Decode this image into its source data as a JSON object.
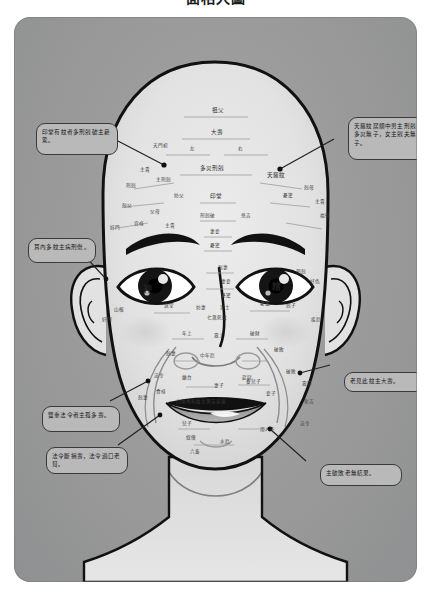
{
  "title": "面相大圖",
  "panel": {
    "background_color": "#9c9c9c",
    "callout_fill": "#b9b9b9",
    "callout_border": "#3a3a3a",
    "face_fill": "#e3e3e3",
    "line_color": "#111111"
  },
  "callouts": [
    {
      "id": "yintang",
      "text": "印堂有紋者多刑剋破主憂驚。",
      "x": 22,
      "y": 106,
      "w": 82,
      "h": 32,
      "anchor_x": 148,
      "anchor_y": 146
    },
    {
      "id": "tianluo",
      "text": "天羅紋居額中男主刑剋多災無子，女主剋夫無子。",
      "x": 334,
      "y": 100,
      "w": 78,
      "h": 43,
      "anchor_x": 281,
      "anchor_y": 152
    },
    {
      "id": "ear-lines",
      "text": "耳內多紋主病刑傷。",
      "x": 14,
      "y": 221,
      "w": 68,
      "h": 25,
      "anchor_x": 84,
      "anchor_y": 270
    },
    {
      "id": "old-longevity",
      "text": "老見此紋主大壽。",
      "x": 330,
      "y": 355,
      "w": 80,
      "h": 20,
      "anchor_x": 300,
      "anchor_y": 372
    },
    {
      "id": "double-faling",
      "text": "雙重法令者主孤多壽。",
      "x": 28,
      "y": 389,
      "w": 78,
      "h": 26,
      "anchor_x": 136,
      "anchor_y": 378
    },
    {
      "id": "faling-broken",
      "text": "法令斷損壽，法令過口老貧。",
      "x": 32,
      "y": 430,
      "w": 82,
      "h": 27,
      "anchor_x": 150,
      "anchor_y": 404
    },
    {
      "id": "ruin-no-result",
      "text": "主破敗老無結果。",
      "x": 306,
      "y": 447,
      "w": 82,
      "h": 22,
      "anchor_x": 246,
      "anchor_y": 420
    }
  ],
  "face_labels": {
    "forehead": [
      {
        "t": "祖父",
        "x": 198,
        "y": 90,
        "cls": "rlabel mid"
      },
      {
        "t": "大壽",
        "x": 197,
        "y": 112,
        "cls": "rlabel mid"
      },
      {
        "t": "左",
        "x": 176,
        "y": 129,
        "cls": "rlabel"
      },
      {
        "t": "右",
        "x": 224,
        "y": 129,
        "cls": "rlabel"
      },
      {
        "t": "多災刑剋",
        "x": 186,
        "y": 148,
        "cls": "rlabel mid"
      },
      {
        "t": "天門初",
        "x": 139,
        "y": 126,
        "cls": "rlabel"
      },
      {
        "t": "天羅紋",
        "x": 253,
        "y": 155,
        "cls": "rlabel mid"
      },
      {
        "t": "主貴",
        "x": 126,
        "y": 150,
        "cls": "rlabel"
      },
      {
        "t": "刑剋",
        "x": 112,
        "y": 166,
        "cls": "rlabel"
      },
      {
        "t": "剋父",
        "x": 108,
        "y": 186,
        "cls": "rlabel"
      },
      {
        "t": "奸門",
        "x": 96,
        "y": 208,
        "cls": "rlabel"
      },
      {
        "t": "主貴",
        "x": 301,
        "y": 182,
        "cls": "rlabel"
      },
      {
        "t": "剋母",
        "x": 290,
        "y": 168,
        "cls": "rlabel"
      },
      {
        "t": "憂驚",
        "x": 269,
        "y": 176,
        "cls": "rlabel"
      },
      {
        "t": "妨父",
        "x": 160,
        "y": 176,
        "cls": "rlabel"
      },
      {
        "t": "印堂",
        "x": 196,
        "y": 176,
        "cls": "rlabel mid"
      },
      {
        "t": "刑剋破",
        "x": 186,
        "y": 196,
        "cls": "rlabel"
      },
      {
        "t": "兇吉",
        "x": 227,
        "y": 196,
        "cls": "rlabel"
      },
      {
        "t": "父母",
        "x": 136,
        "y": 192,
        "cls": "rlabel"
      },
      {
        "t": "官祿",
        "x": 120,
        "y": 204,
        "cls": "rlabel"
      },
      {
        "t": "主刑剋",
        "x": 142,
        "y": 160,
        "cls": "rlabel"
      },
      {
        "t": "主貴",
        "x": 151,
        "y": 206,
        "cls": "rlabel"
      },
      {
        "t": "妻妾",
        "x": 196,
        "y": 212,
        "cls": "rlabel"
      },
      {
        "t": "憂驚",
        "x": 196,
        "y": 226,
        "cls": "rlabel"
      },
      {
        "t": "福德",
        "x": 306,
        "y": 196,
        "cls": "rlabel"
      }
    ],
    "eyes": [
      {
        "t": "神",
        "x": 129,
        "y": 267,
        "cls": "rlabel big"
      },
      {
        "t": "精",
        "x": 258,
        "y": 265,
        "cls": "rlabel big"
      },
      {
        "t": "剋妻",
        "x": 204,
        "y": 248,
        "cls": "rlabel"
      },
      {
        "t": "妻妾",
        "x": 207,
        "y": 262,
        "cls": "rlabel"
      },
      {
        "t": "憂驚",
        "x": 207,
        "y": 276,
        "cls": "rlabel"
      },
      {
        "t": "刑剋",
        "x": 282,
        "y": 252,
        "cls": "rlabel"
      },
      {
        "t": "好色",
        "x": 296,
        "y": 262,
        "cls": "rlabel"
      },
      {
        "t": "淚堂",
        "x": 150,
        "y": 286,
        "cls": "rlabel"
      },
      {
        "t": "妨妻",
        "x": 182,
        "y": 288,
        "cls": "rlabel"
      },
      {
        "t": "男士",
        "x": 206,
        "y": 288,
        "cls": "rlabel"
      },
      {
        "t": "憂驚",
        "x": 246,
        "y": 284,
        "cls": "rlabel"
      },
      {
        "t": "剋子",
        "x": 272,
        "y": 286,
        "cls": "rlabel"
      },
      {
        "t": "七煞死紋",
        "x": 193,
        "y": 298,
        "cls": "rlabel"
      },
      {
        "t": "山根",
        "x": 100,
        "y": 290,
        "cls": "rlabel"
      },
      {
        "t": "奸門",
        "x": 88,
        "y": 300,
        "cls": "rlabel"
      },
      {
        "t": "疾厄",
        "x": 297,
        "y": 300,
        "cls": "rlabel"
      }
    ],
    "nose_cheek": [
      {
        "t": "年上",
        "x": 168,
        "y": 314,
        "cls": "rlabel"
      },
      {
        "t": "壽上",
        "x": 200,
        "y": 316,
        "cls": "rlabel"
      },
      {
        "t": "破財",
        "x": 236,
        "y": 314,
        "cls": "rlabel"
      },
      {
        "t": "中年厄",
        "x": 186,
        "y": 336,
        "cls": "rlabel"
      },
      {
        "t": "剋妻",
        "x": 152,
        "y": 334,
        "cls": "rlabel"
      },
      {
        "t": "破敗",
        "x": 260,
        "y": 330,
        "cls": "rlabel"
      },
      {
        "t": "法令",
        "x": 140,
        "y": 356,
        "cls": "rlabel"
      },
      {
        "t": "破敗",
        "x": 272,
        "y": 352,
        "cls": "rlabel"
      },
      {
        "t": "蘭台",
        "x": 168,
        "y": 358,
        "cls": "rlabel"
      },
      {
        "t": "廷尉",
        "x": 228,
        "y": 358,
        "cls": "rlabel"
      }
    ],
    "mouth": [
      {
        "t": "妻子",
        "x": 200,
        "y": 366,
        "cls": "rlabel"
      },
      {
        "t": "養兒子",
        "x": 232,
        "y": 362,
        "cls": "rlabel"
      },
      {
        "t": "食祿",
        "x": 142,
        "y": 372,
        "cls": "rlabel"
      },
      {
        "t": "妾子",
        "x": 252,
        "y": 374,
        "cls": "rlabel"
      },
      {
        "t": "壽帶",
        "x": 288,
        "y": 364,
        "cls": "rlabel"
      },
      {
        "t": "口角內有紋主勞苦奔波",
        "x": 162,
        "y": 382,
        "cls": "rlabel"
      },
      {
        "t": "化吉",
        "x": 290,
        "y": 382,
        "cls": "rlabel"
      },
      {
        "t": "剋妻",
        "x": 124,
        "y": 378,
        "cls": "rlabel"
      },
      {
        "t": "兒子",
        "x": 168,
        "y": 404,
        "cls": "rlabel"
      },
      {
        "t": "法令",
        "x": 286,
        "y": 404,
        "cls": "rlabel"
      },
      {
        "t": "用人不",
        "x": 246,
        "y": 410,
        "cls": "rlabel"
      },
      {
        "t": "奴僕",
        "x": 172,
        "y": 418,
        "cls": "rlabel"
      },
      {
        "t": "水厄",
        "x": 206,
        "y": 422,
        "cls": "rlabel"
      },
      {
        "t": "六畜",
        "x": 176,
        "y": 432,
        "cls": "rlabel"
      }
    ]
  }
}
